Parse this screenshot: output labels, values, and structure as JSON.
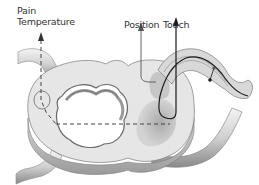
{
  "diagram": {
    "labels": {
      "pain": "Pain",
      "temperature": "Temperature",
      "position": "Position",
      "touch": "Touch"
    },
    "colors": {
      "background": "#ffffff",
      "cord_light": "#e4e4e4",
      "cord_mid": "#bdbdbd",
      "cord_dark": "#7a7a7a",
      "pathway": "#1a1a1a",
      "label_text": "#333333"
    }
  }
}
